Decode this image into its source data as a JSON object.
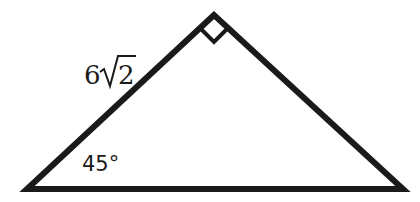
{
  "diagram": {
    "type": "right-triangle",
    "vertices": {
      "apex": [
        214,
        15
      ],
      "left": [
        27,
        189
      ],
      "right": [
        403,
        189
      ]
    },
    "right_angle_at": "apex",
    "labels": {
      "side_coefficient": "6",
      "side_radicand": "2",
      "side_text": "6√2",
      "angle": "45°"
    },
    "colors": {
      "stroke": "#1a1a1a",
      "background": "#ffffff"
    }
  }
}
